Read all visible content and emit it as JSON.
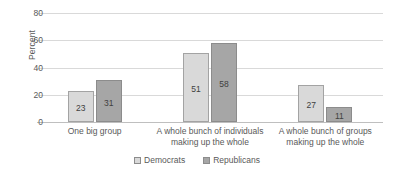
{
  "chart_data": {
    "type": "bar",
    "title": "",
    "xlabel": "",
    "ylabel": "Percent",
    "ylim": [
      0,
      80
    ],
    "yticks": [
      0,
      20,
      40,
      60,
      80
    ],
    "ytick_labels": [
      "0",
      "20",
      "40",
      "60",
      "80"
    ],
    "grid": true,
    "legend_position": "bottom",
    "categories": [
      "One big group",
      "A whole bunch of individuals making up the whole",
      "A whole bunch of groups making up the whole"
    ],
    "category_lines": [
      [
        "One big group"
      ],
      [
        "A whole bunch of individuals",
        "making up the whole"
      ],
      [
        "A whole bunch of groups",
        "making up the whole"
      ]
    ],
    "series": [
      {
        "name": "Democrats",
        "color": "#D9D9D9",
        "values": [
          23,
          51,
          27
        ],
        "value_labels": [
          "23",
          "51",
          "27"
        ]
      },
      {
        "name": "Republicans",
        "color": "#A6A6A6",
        "values": [
          31,
          58,
          11
        ],
        "value_labels": [
          "31",
          "58",
          "11"
        ]
      }
    ]
  },
  "legend": {
    "items": [
      {
        "label": "Democrats",
        "swatch": "legend-swatch-democrats"
      },
      {
        "label": "Republicans",
        "swatch": "legend-swatch-republicans"
      }
    ]
  },
  "axis": {
    "y_title": "Percent"
  }
}
